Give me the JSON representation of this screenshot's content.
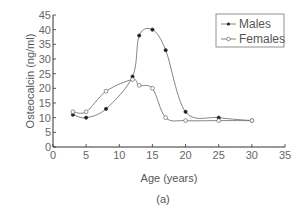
{
  "chart_data": {
    "type": "line",
    "title": "",
    "caption": "(a)",
    "xlabel": "Age (years)",
    "ylabel": "Osteocalcin (ng/ml)",
    "xlim": [
      0,
      35
    ],
    "ylim": [
      0,
      45
    ],
    "xticks": [
      0,
      5,
      10,
      15,
      20,
      25,
      30,
      35
    ],
    "yticks": [
      0,
      5,
      10,
      15,
      20,
      25,
      30,
      35,
      40,
      45
    ],
    "grid": false,
    "legend_position": "upper right",
    "series": [
      {
        "name": "Males",
        "marker": "filled-circle",
        "x": [
          3,
          5,
          8,
          12,
          13,
          15,
          17,
          20,
          25,
          30
        ],
        "values": [
          11,
          10,
          13,
          24,
          38,
          40,
          33,
          12,
          10,
          9
        ]
      },
      {
        "name": "Females",
        "marker": "open-circle",
        "x": [
          3,
          5,
          8,
          12,
          13,
          15,
          17,
          20,
          25,
          30
        ],
        "values": [
          12,
          12,
          19,
          23,
          21,
          20,
          10,
          9,
          9,
          9
        ]
      }
    ]
  },
  "legend": {
    "males": "Males",
    "females": "Females"
  },
  "labels": {
    "x": "Age (years)",
    "y": "Osteocalcin (ng/ml)",
    "caption": "(a)"
  }
}
